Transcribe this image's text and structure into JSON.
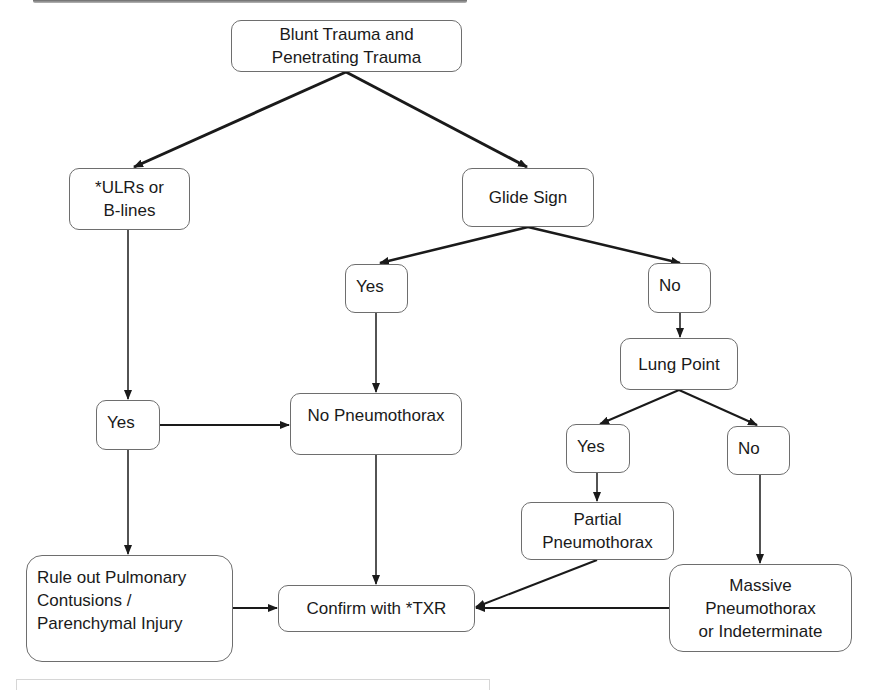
{
  "diagram": {
    "type": "flowchart",
    "nodes": {
      "root": "Blunt Trauma and\nPenetrating Trauma",
      "ulrs": "*ULRs or\nB-lines",
      "glide": "Glide Sign",
      "glide_yes": "Yes",
      "glide_no": "No",
      "lung_point": "Lung Point",
      "ulrs_yes": "Yes",
      "no_ptx": "No Pneumothorax",
      "lp_yes": "Yes",
      "lp_no": "No",
      "partial": "Partial\nPneumothorax",
      "rule_out": "Rule out Pulmonary\nContusions /\nParenchymal Injury",
      "confirm": "Confirm with *TXR",
      "massive": "Massive\nPneumothorax\nor Indeterminate"
    },
    "edges": [
      [
        "root",
        "ulrs"
      ],
      [
        "root",
        "glide"
      ],
      [
        "glide",
        "glide_yes"
      ],
      [
        "glide",
        "glide_no"
      ],
      [
        "glide_no",
        "lung_point"
      ],
      [
        "lung_point",
        "lp_yes"
      ],
      [
        "lung_point",
        "lp_no"
      ],
      [
        "ulrs",
        "ulrs_yes"
      ],
      [
        "ulrs_yes",
        "no_ptx"
      ],
      [
        "glide_yes",
        "no_ptx"
      ],
      [
        "ulrs_yes",
        "rule_out"
      ],
      [
        "lp_yes",
        "partial"
      ],
      [
        "lp_no",
        "massive"
      ],
      [
        "rule_out",
        "confirm"
      ],
      [
        "no_ptx",
        "confirm"
      ],
      [
        "partial",
        "confirm"
      ],
      [
        "massive",
        "confirm"
      ]
    ],
    "colors": {
      "line": "#1a1a1a",
      "border": "#6e6e6e",
      "background": "#ffffff"
    }
  }
}
